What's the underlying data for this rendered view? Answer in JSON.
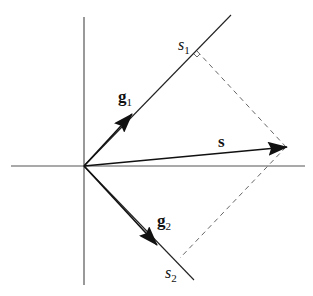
{
  "diagram": {
    "labels": {
      "s1": {
        "base": "s",
        "sub": "1"
      },
      "s2": {
        "base": "s",
        "sub": "2"
      },
      "g1": {
        "base": "g",
        "sub": "1"
      },
      "g2": {
        "base": "g",
        "sub": "2"
      },
      "s": "s"
    },
    "colors": {
      "line": "#222222",
      "axis": "#555555",
      "dashed": "#666666"
    }
  }
}
